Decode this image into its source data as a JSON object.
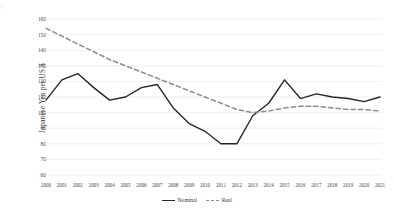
{
  "chart_data": {
    "type": "line",
    "title": "",
    "xlabel": "",
    "ylabel": "Japanese Yen per US $",
    "ylim": [
      60,
      160
    ],
    "ytick_step": 10,
    "yticks": [
      160,
      150,
      140,
      130,
      120,
      110,
      100,
      90,
      80,
      70,
      60
    ],
    "grid": true,
    "grid_axis": "y",
    "legend_position": "bottom",
    "x": [
      2000,
      2001,
      2002,
      2003,
      2004,
      2005,
      2006,
      2007,
      2008,
      2009,
      2010,
      2011,
      2012,
      2013,
      2014,
      2015,
      2016,
      2017,
      2018,
      2019,
      2020,
      2021
    ],
    "categories": [
      "2000",
      "2001",
      "2002",
      "2003",
      "2004",
      "2005",
      "2006",
      "2007",
      "2008",
      "2009",
      "2010",
      "2011",
      "2012",
      "2013",
      "2014",
      "2015",
      "2016",
      "2017",
      "2018",
      "2019",
      "2020",
      "2021"
    ],
    "series": [
      {
        "name": "Nominal",
        "style": "solid",
        "color": "#262626",
        "values": [
          108,
          121,
          125,
          116,
          108,
          110,
          116,
          118,
          103,
          93,
          88,
          80,
          80,
          98,
          106,
          121,
          109,
          112,
          110,
          109,
          107,
          110
        ]
      },
      {
        "name": "Real",
        "style": "dashed",
        "color": "#8a8d90",
        "values": [
          154,
          149,
          144,
          139,
          134,
          130,
          126,
          122,
          118,
          114,
          110,
          106,
          102,
          100,
          101,
          103,
          104,
          104,
          103,
          102,
          102,
          101
        ]
      }
    ]
  },
  "legend": {
    "items": [
      {
        "label": "Nominal",
        "style": "solid"
      },
      {
        "label": "Real",
        "style": "dashed"
      }
    ]
  },
  "axis": {
    "y_title": "Japanese Yen per US $"
  },
  "colors": {
    "nominal": "#262626",
    "real": "#8a8d90",
    "grid": "#e9eaec",
    "text": "#3a3a3a",
    "background": "#ffffff"
  }
}
